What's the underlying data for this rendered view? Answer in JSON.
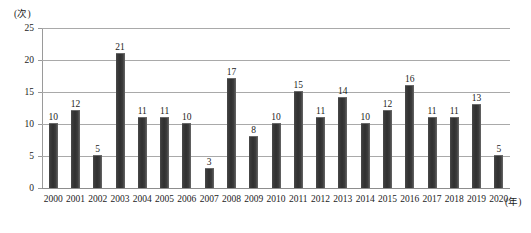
{
  "chart_data": {
    "type": "bar",
    "title": "",
    "subtitle": "",
    "xlabel": "(年)",
    "ylabel": "(次)",
    "categories": [
      "2000",
      "2001",
      "2002",
      "2003",
      "2004",
      "2005",
      "2006",
      "2007",
      "2008",
      "2009",
      "2010",
      "2011",
      "2012",
      "2013",
      "2014",
      "2015",
      "2016",
      "2017",
      "2018",
      "2019",
      "2020"
    ],
    "values": [
      10,
      12,
      5,
      21,
      11,
      11,
      10,
      3,
      17,
      8,
      10,
      15,
      11,
      14,
      10,
      12,
      16,
      11,
      11,
      13,
      5
    ],
    "data_labels": [
      "10",
      "12",
      "5",
      "21",
      "11",
      "11",
      "10",
      "3",
      "17",
      "8",
      "10",
      "15",
      "11",
      "14",
      "10",
      "12",
      "16",
      "11",
      "11",
      "13",
      "5"
    ],
    "ylim": [
      0,
      25
    ],
    "yticks": [
      0,
      5,
      10,
      15,
      20,
      25
    ],
    "ytick_labels": [
      "0",
      "5",
      "10",
      "15",
      "20",
      "25"
    ],
    "grid": true,
    "legend": false,
    "legend_position": "none",
    "series": [
      {
        "name": "",
        "values": [
          10,
          12,
          5,
          21,
          11,
          11,
          10,
          3,
          17,
          8,
          10,
          15,
          11,
          14,
          10,
          12,
          16,
          11,
          11,
          13,
          5
        ]
      }
    ],
    "colors": {
      "bar": "#383838",
      "bar_highlight": "#6d6d6d",
      "gridline": "#a9a9a9",
      "axis": "#8d8d8d",
      "text": "#1c1c1c",
      "background": "#ffffff"
    }
  }
}
